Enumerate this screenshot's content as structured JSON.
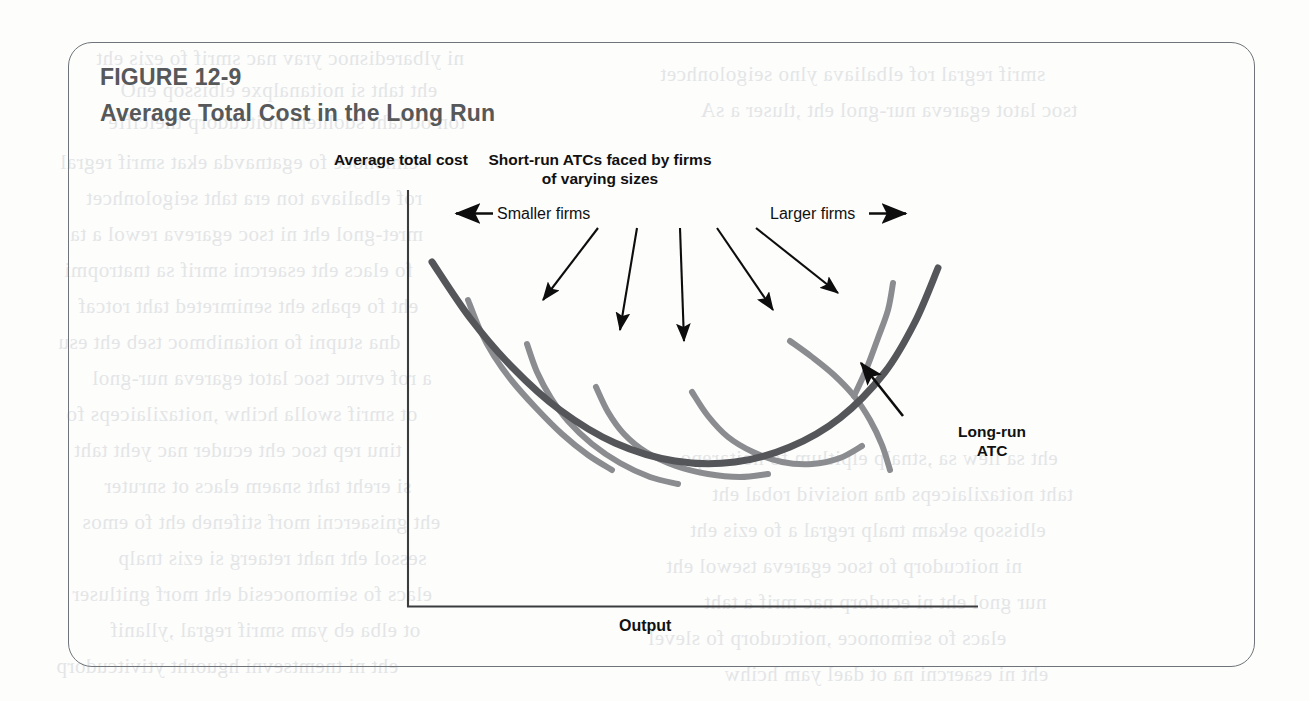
{
  "figure": {
    "number": "FIGURE 12-9",
    "title": "Average Total Cost in the Long Run",
    "title_color": "#56585a",
    "border_color": "#6e7479"
  },
  "labels": {
    "y_axis": "Average total cost",
    "x_axis": "Output",
    "short_run_note": "Short-run ATCs faced by firms of varying sizes",
    "short_run_note_line1": "Short-run ATCs faced by firms",
    "short_run_note_line2": "of varying sizes",
    "smaller_firms": "Smaller firms",
    "larger_firms": "Larger firms",
    "long_run_atc_line1": "Long-run",
    "long_run_atc_line2": "ATC"
  },
  "colors": {
    "long_run_curve": "#55565a",
    "short_run_curve": "#8a8c8f",
    "axis": "#3a3c3e",
    "arrow": "#0d0d0d",
    "ghost_text": "#cfd3d6"
  },
  "chart_data": {
    "type": "line",
    "title": "Average Total Cost in the Long Run",
    "xlabel": "Output",
    "ylabel": "Average total cost",
    "grid": false,
    "axes_shown": [
      "x",
      "y"
    ],
    "legend": "annotations",
    "axis_pixels": {
      "y_axis_x": 408,
      "y_axis_top": 190,
      "origin_x": 408,
      "origin_y": 607,
      "x_axis_right": 978
    },
    "series": [
      {
        "name": "Long-run ATC",
        "role": "envelope",
        "color": "#55565a",
        "width": 7,
        "points": [
          [
            432,
            262
          ],
          [
            470,
            318
          ],
          [
            512,
            367
          ],
          [
            560,
            410
          ],
          [
            615,
            443
          ],
          [
            675,
            461
          ],
          [
            735,
            462
          ],
          [
            790,
            447
          ],
          [
            840,
            418
          ],
          [
            885,
            372
          ],
          [
            915,
            322
          ],
          [
            938,
            268
          ]
        ]
      },
      {
        "name": "Short-run ATC 1 (smallest firm)",
        "role": "short-run",
        "color": "#8a8c8f",
        "width": 6,
        "tangency": [
          500,
          356
        ],
        "points": [
          [
            468,
            300
          ],
          [
            480,
            330
          ],
          [
            494,
            356
          ],
          [
            512,
            381
          ],
          [
            536,
            408
          ],
          [
            562,
            434
          ],
          [
            588,
            455
          ],
          [
            612,
            470
          ]
        ]
      },
      {
        "name": "Short-run ATC 2",
        "role": "short-run",
        "color": "#8a8c8f",
        "width": 6,
        "tangency": [
          560,
          410
        ],
        "points": [
          [
            527,
            344
          ],
          [
            537,
            372
          ],
          [
            551,
            398
          ],
          [
            568,
            421
          ],
          [
            592,
            444
          ],
          [
            620,
            463
          ],
          [
            650,
            477
          ],
          [
            678,
            484
          ]
        ]
      },
      {
        "name": "Short-run ATC 3 (middle)",
        "role": "short-run",
        "color": "#8a8c8f",
        "width": 6,
        "tangency": [
          660,
          459
        ],
        "points": [
          [
            596,
            387
          ],
          [
            608,
            412
          ],
          [
            624,
            434
          ],
          [
            646,
            452
          ],
          [
            676,
            466
          ],
          [
            708,
            474
          ],
          [
            740,
            477
          ],
          [
            768,
            474
          ]
        ]
      },
      {
        "name": "Short-run ATC 4",
        "role": "short-run",
        "color": "#8a8c8f",
        "width": 6,
        "tangency": [
          775,
          453
        ],
        "points": [
          [
            692,
            392
          ],
          [
            708,
            416
          ],
          [
            728,
            437
          ],
          [
            753,
            452
          ],
          [
            782,
            462
          ],
          [
            812,
            464
          ],
          [
            840,
            458
          ],
          [
            862,
            446
          ]
        ]
      },
      {
        "name": "Short-run ATC 5 (largest firm)",
        "role": "short-run",
        "color": "#8a8c8f",
        "width": 6,
        "tangency": [
          866,
          396
        ],
        "points": [
          [
            790,
            341
          ],
          [
            812,
            357
          ],
          [
            834,
            375
          ],
          [
            854,
            396
          ],
          [
            870,
            420
          ],
          [
            882,
            445
          ],
          [
            890,
            470
          ],
          [
            893,
            283
          ]
        ]
      }
    ],
    "annotations": [
      {
        "name": "smaller-firms",
        "text": "Smaller firms",
        "direction": "left",
        "x": 497,
        "y": 214
      },
      {
        "name": "larger-firms",
        "text": "Larger firms",
        "direction": "right",
        "x": 770,
        "y": 214
      },
      {
        "name": "short-run-note",
        "text": "Short-run ATCs faced by firms of varying sizes",
        "x": 600,
        "y": 150,
        "arrow_count": 5
      },
      {
        "name": "long-run-atc",
        "text": "Long-run ATC",
        "x": 937,
        "y": 422
      }
    ],
    "pointer_arrows": [
      {
        "from": [
          598,
          228
        ],
        "to": [
          543,
          300
        ]
      },
      {
        "from": [
          637,
          228
        ],
        "to": [
          620,
          330
        ]
      },
      {
        "from": [
          680,
          228
        ],
        "to": [
          684,
          341
        ]
      },
      {
        "from": [
          717,
          228
        ],
        "to": [
          773,
          310
        ]
      },
      {
        "from": [
          756,
          228
        ],
        "to": [
          838,
          293
        ]
      },
      {
        "from": [
          903,
          416
        ],
        "to": [
          861,
          363
        ]
      }
    ]
  },
  "background_ghost_lines": [
    {
      "text": "ni ylbaredisnoc yrav nac smrif fo ezis eht",
      "x": 96,
      "y": 46
    },
    {
      "text": "eht taht si noitanalpxe elbissop enO",
      "x": 120,
      "y": 78
    },
    {
      "text": "ton od taht sdohtem noitcudorp tneiciffe",
      "x": 108,
      "y": 110
    },
    {
      "text": "cimonoce fo egatnavda ekat smrif regral",
      "x": 60,
      "y": 150
    },
    {
      "text": "rof elbaliava ton era taht seigolonhcet",
      "x": 86,
      "y": 186
    },
    {
      "text": "mret-gnol eht ni tsoc egareva rewol a ta",
      "x": 70,
      "y": 222
    },
    {
      "text": "fo elacs eht esaercni smrif sa tnatropmi",
      "x": 64,
      "y": 258
    },
    {
      "text": "eht fo epahs eht senimreted taht rotcaf",
      "x": 78,
      "y": 294
    },
    {
      "text": "dna stupni fo noitanibmoc tseb eht esu",
      "x": 58,
      "y": 330
    },
    {
      "text": "a rof evruc tsoc latot egareva nur-gnol",
      "x": 92,
      "y": 366
    },
    {
      "text": "ot smrif swolla hcihw ,noitazilaiceps fo",
      "x": 66,
      "y": 402
    },
    {
      "text": "tinu rep tsoc eht ecuder nac yeht taht",
      "x": 74,
      "y": 438
    },
    {
      "text": "si ereht taht snaem elacs ot snruter",
      "x": 104,
      "y": 474
    },
    {
      "text": "eht gnisaercni morf stifeneb eht fo emos",
      "x": 82,
      "y": 510
    },
    {
      "text": "sessol eht naht retaerg si ezis tnalp",
      "x": 118,
      "y": 546
    },
    {
      "text": "elacs fo seimonocesid eht morf gnitluser",
      "x": 72,
      "y": 582
    },
    {
      "text": "ot elba eb yam smrif regral ,yllanif",
      "x": 110,
      "y": 618
    },
    {
      "text": "eht ni tnemtsevni hguorht ytivitcudorp",
      "x": 56,
      "y": 654
    },
    {
      "text": "smrif regral rof elbaliava ylno seigolonhcet",
      "x": 660,
      "y": 62
    },
    {
      "text": "tsoc latot egareva nur-gnol eht ,tluser a sA",
      "x": 700,
      "y": 98
    },
    {
      "text": "eht sa llew sa ,stnalp elpitlum fo noitarepo",
      "x": 680,
      "y": 446
    },
    {
      "text": "taht noitazilaiceps dna noisivid robal eht",
      "x": 712,
      "y": 482
    },
    {
      "text": "elbissop sekam tnalp regral a fo ezis eht",
      "x": 690,
      "y": 518
    },
    {
      "text": "ni noitcudorp fo tsoc egareva tsewol eht",
      "x": 666,
      "y": 554
    },
    {
      "text": "nur gnol eht ni ecudorp nac mrif a taht",
      "x": 704,
      "y": 590
    },
    {
      "text": "elacs fo seimonoce ,noitcudorp fo slevel",
      "x": 648,
      "y": 626
    },
    {
      "text": "eht ni esaercni na ot dael yam hcihw",
      "x": 724,
      "y": 662
    }
  ]
}
